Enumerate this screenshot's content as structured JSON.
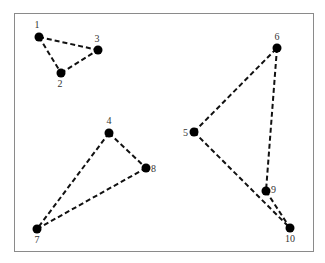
{
  "diagram": {
    "frame": {
      "x": 14,
      "y": 13,
      "w": 299,
      "h": 238,
      "stroke": "#8a8a8a"
    },
    "edge_color": "#111111",
    "node_color": "#000000",
    "nodes": [
      {
        "id": "1",
        "x": 39,
        "y": 37,
        "lx": 37,
        "ly": 28,
        "anchor": "middle"
      },
      {
        "id": "2",
        "x": 61,
        "y": 73,
        "lx": 60,
        "ly": 87,
        "anchor": "middle"
      },
      {
        "id": "3",
        "x": 98,
        "y": 50,
        "lx": 97,
        "ly": 42,
        "anchor": "middle"
      },
      {
        "id": "4",
        "x": 109,
        "y": 133,
        "lx": 109,
        "ly": 124,
        "anchor": "middle"
      },
      {
        "id": "5",
        "x": 194,
        "y": 132,
        "lx": 188,
        "ly": 136,
        "anchor": "end"
      },
      {
        "id": "6",
        "x": 277,
        "y": 48,
        "lx": 277,
        "ly": 40,
        "anchor": "middle"
      },
      {
        "id": "7",
        "x": 37,
        "y": 229,
        "lx": 37,
        "ly": 243,
        "anchor": "middle"
      },
      {
        "id": "8",
        "x": 146,
        "y": 168,
        "lx": 151,
        "ly": 172,
        "anchor": "start"
      },
      {
        "id": "9",
        "x": 266,
        "y": 191,
        "lx": 271,
        "ly": 193,
        "anchor": "start"
      },
      {
        "id": "10",
        "x": 290,
        "y": 228,
        "lx": 290,
        "ly": 242,
        "anchor": "middle"
      }
    ],
    "edges": [
      [
        "1",
        "2"
      ],
      [
        "1",
        "3"
      ],
      [
        "2",
        "3"
      ],
      [
        "4",
        "7"
      ],
      [
        "4",
        "8"
      ],
      [
        "7",
        "8"
      ],
      [
        "5",
        "6"
      ],
      [
        "5",
        "10"
      ],
      [
        "6",
        "9"
      ],
      [
        "9",
        "10"
      ]
    ]
  }
}
